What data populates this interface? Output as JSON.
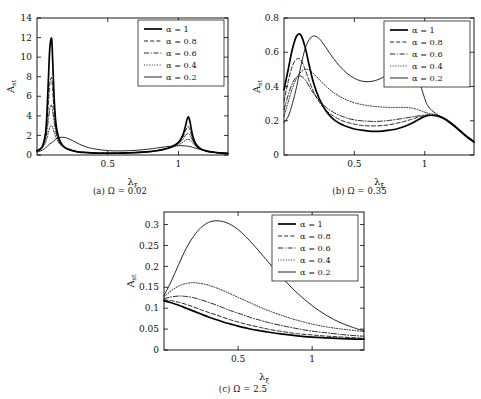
{
  "figure": {
    "ylabel": "A",
    "ylabel_sub": "st",
    "xlabel": "λ",
    "xlabel_sub": "ξ"
  },
  "legend": {
    "entries": [
      {
        "label": "α = 1",
        "style": "solid-thick"
      },
      {
        "label": "α = 0.8",
        "style": "dashed"
      },
      {
        "label": "α = 0.6",
        "style": "dashdot"
      },
      {
        "label": "α = 0.4",
        "style": "dotted"
      },
      {
        "label": "α = 0.2",
        "style": "solid-thin"
      }
    ]
  },
  "panels": [
    {
      "id": "a",
      "caption": "(a) Ω = 0.02",
      "xticks": [
        0.5,
        1
      ],
      "xticklabels": [
        "0.5",
        "1"
      ],
      "yticks": [
        0,
        2,
        4,
        6,
        8,
        10,
        12,
        14
      ],
      "yticklabels": [
        "0",
        "2",
        "4",
        "6",
        "8",
        "10",
        "12",
        "14"
      ],
      "xlim": [
        0,
        1.35
      ],
      "ylim": [
        0,
        14
      ]
    },
    {
      "id": "b",
      "caption": "(b) Ω = 0.35",
      "xticks": [
        0.5,
        1
      ],
      "xticklabels": [
        "0.5",
        "1"
      ],
      "yticks": [
        0,
        0.2,
        0.4,
        0.6,
        0.8
      ],
      "yticklabels": [
        "0",
        "0.2",
        "0.4",
        "0.6",
        "0.8"
      ],
      "xlim": [
        0,
        1.35
      ],
      "ylim": [
        0,
        0.8
      ]
    },
    {
      "id": "c",
      "caption": "(c) Ω = 2.5",
      "xticks": [
        0.5,
        1
      ],
      "xticklabels": [
        "0.5",
        "1"
      ],
      "yticks": [
        0,
        0.05,
        0.1,
        0.15,
        0.2,
        0.25,
        0.3
      ],
      "yticklabels": [
        "0",
        "0.05",
        "0.1",
        "0.15",
        "0.2",
        "0.25",
        "0.3"
      ],
      "xlim": [
        0,
        1.35
      ],
      "ylim": [
        0,
        0.33
      ]
    }
  ],
  "chart_data": [
    {
      "type": "line",
      "panel": "a",
      "title": "(a) Ω = 0.02",
      "xlabel": "λ_ξ",
      "ylabel": "A_st",
      "xlim": [
        0,
        1.35
      ],
      "ylim": [
        0,
        14
      ],
      "grid": false,
      "legend_position": "top-right",
      "x": [
        0,
        0.02,
        0.04,
        0.06,
        0.07,
        0.08,
        0.09,
        0.1,
        0.105,
        0.11,
        0.12,
        0.13,
        0.14,
        0.16,
        0.18,
        0.2,
        0.22,
        0.25,
        0.3,
        0.35,
        0.4,
        0.5,
        0.6,
        0.7,
        0.8,
        0.85,
        0.9,
        0.95,
        1.0,
        1.03,
        1.05,
        1.06,
        1.07,
        1.08,
        1.09,
        1.1,
        1.12,
        1.15,
        1.2,
        1.25,
        1.3,
        1.35
      ],
      "series": [
        {
          "name": "α = 1",
          "style": "solid-thick",
          "values": [
            0.45,
            0.6,
            0.95,
            2.2,
            4.2,
            7.5,
            10.8,
            11.9,
            11.6,
            10.0,
            6.2,
            3.8,
            2.6,
            1.5,
            1.0,
            0.75,
            0.6,
            0.45,
            0.3,
            0.25,
            0.2,
            0.18,
            0.2,
            0.25,
            0.35,
            0.45,
            0.6,
            0.85,
            1.3,
            2.0,
            3.0,
            3.6,
            3.9,
            3.5,
            2.7,
            2.0,
            1.2,
            0.7,
            0.4,
            0.28,
            0.2,
            0.15
          ]
        },
        {
          "name": "α = 0.8",
          "style": "dashed",
          "values": [
            0.42,
            0.58,
            0.9,
            1.9,
            3.2,
            5.2,
            7.2,
            7.9,
            7.7,
            6.8,
            4.6,
            3.1,
            2.2,
            1.35,
            0.95,
            0.72,
            0.58,
            0.44,
            0.3,
            0.24,
            0.2,
            0.18,
            0.2,
            0.25,
            0.34,
            0.44,
            0.58,
            0.82,
            1.25,
            1.8,
            2.5,
            2.8,
            2.9,
            2.6,
            2.1,
            1.65,
            1.05,
            0.65,
            0.38,
            0.27,
            0.2,
            0.15
          ]
        },
        {
          "name": "α = 0.6",
          "style": "dashdot",
          "values": [
            0.4,
            0.55,
            0.85,
            1.6,
            2.4,
            3.6,
            4.7,
            5.1,
            5.0,
            4.6,
            3.5,
            2.6,
            1.95,
            1.25,
            0.92,
            0.7,
            0.57,
            0.44,
            0.31,
            0.25,
            0.21,
            0.19,
            0.21,
            0.26,
            0.35,
            0.45,
            0.58,
            0.8,
            1.2,
            1.6,
            2.0,
            2.15,
            2.2,
            2.05,
            1.8,
            1.5,
            1.0,
            0.62,
            0.37,
            0.26,
            0.2,
            0.15
          ]
        },
        {
          "name": "α = 0.4",
          "style": "dotted",
          "values": [
            0.38,
            0.5,
            0.75,
            1.25,
            1.7,
            2.3,
            2.8,
            3.0,
            2.98,
            2.85,
            2.4,
            1.95,
            1.6,
            1.12,
            0.87,
            0.7,
            0.58,
            0.46,
            0.33,
            0.27,
            0.23,
            0.21,
            0.23,
            0.28,
            0.37,
            0.46,
            0.58,
            0.76,
            1.05,
            1.3,
            1.5,
            1.58,
            1.6,
            1.55,
            1.42,
            1.25,
            0.92,
            0.6,
            0.37,
            0.27,
            0.21,
            0.16
          ]
        },
        {
          "name": "α = 0.2",
          "style": "solid-thin",
          "values": [
            0.3,
            0.38,
            0.52,
            0.72,
            0.85,
            0.98,
            1.12,
            1.22,
            1.27,
            1.32,
            1.45,
            1.58,
            1.68,
            1.79,
            1.82,
            1.78,
            1.68,
            1.48,
            1.1,
            0.82,
            0.64,
            0.45,
            0.42,
            0.48,
            0.62,
            0.72,
            0.82,
            0.9,
            0.95,
            0.95,
            0.93,
            0.91,
            0.89,
            0.86,
            0.83,
            0.79,
            0.7,
            0.58,
            0.42,
            0.31,
            0.24,
            0.18
          ]
        }
      ]
    },
    {
      "type": "line",
      "panel": "b",
      "title": "(b) Ω = 0.35",
      "xlabel": "λ_ξ",
      "ylabel": "A_st",
      "xlim": [
        0,
        1.35
      ],
      "ylim": [
        0,
        0.8
      ],
      "grid": false,
      "legend_position": "top-right",
      "x": [
        0,
        0.03,
        0.06,
        0.09,
        0.12,
        0.15,
        0.18,
        0.21,
        0.25,
        0.3,
        0.35,
        0.4,
        0.45,
        0.5,
        0.55,
        0.6,
        0.65,
        0.7,
        0.75,
        0.8,
        0.85,
        0.9,
        0.95,
        1.0,
        1.02,
        1.05,
        1.1,
        1.15,
        1.2,
        1.25,
        1.3,
        1.35
      ],
      "series": [
        {
          "name": "α = 1",
          "style": "solid-thick",
          "values": [
            0.38,
            0.5,
            0.62,
            0.695,
            0.7,
            0.63,
            0.52,
            0.42,
            0.33,
            0.255,
            0.21,
            0.183,
            0.165,
            0.152,
            0.145,
            0.14,
            0.138,
            0.14,
            0.145,
            0.152,
            0.165,
            0.182,
            0.205,
            0.225,
            0.23,
            0.232,
            0.225,
            0.205,
            0.175,
            0.14,
            0.105,
            0.075
          ]
        },
        {
          "name": "α = 0.8",
          "style": "dashed",
          "values": [
            0.315,
            0.43,
            0.52,
            0.56,
            0.555,
            0.5,
            0.43,
            0.37,
            0.31,
            0.26,
            0.228,
            0.205,
            0.19,
            0.18,
            0.173,
            0.17,
            0.17,
            0.172,
            0.177,
            0.185,
            0.195,
            0.207,
            0.22,
            0.228,
            0.23,
            0.232,
            0.226,
            0.208,
            0.178,
            0.143,
            0.108,
            0.078
          ]
        },
        {
          "name": "α = 0.6",
          "style": "dashdot",
          "values": [
            0.265,
            0.35,
            0.42,
            0.455,
            0.46,
            0.44,
            0.4,
            0.36,
            0.32,
            0.278,
            0.25,
            0.23,
            0.215,
            0.205,
            0.2,
            0.197,
            0.196,
            0.198,
            0.202,
            0.208,
            0.214,
            0.221,
            0.228,
            0.233,
            0.234,
            0.234,
            0.228,
            0.21,
            0.18,
            0.145,
            0.11,
            0.08
          ]
        },
        {
          "name": "α = 0.4",
          "style": "dotted",
          "values": [
            0.225,
            0.31,
            0.39,
            0.45,
            0.485,
            0.5,
            0.495,
            0.475,
            0.44,
            0.4,
            0.365,
            0.34,
            0.32,
            0.305,
            0.295,
            0.288,
            0.283,
            0.28,
            0.278,
            0.278,
            0.278,
            0.275,
            0.265,
            0.25,
            0.245,
            0.24,
            0.23,
            0.212,
            0.183,
            0.148,
            0.112,
            0.082
          ]
        },
        {
          "name": "α = 0.2",
          "style": "solid-thin",
          "values": [
            0.19,
            0.225,
            0.3,
            0.4,
            0.52,
            0.62,
            0.675,
            0.695,
            0.68,
            0.625,
            0.565,
            0.515,
            0.475,
            0.448,
            0.432,
            0.428,
            0.435,
            0.452,
            0.475,
            0.495,
            0.508,
            0.505,
            0.45,
            0.33,
            0.29,
            0.26,
            0.23,
            0.205,
            0.175,
            0.142,
            0.108,
            0.08
          ]
        }
      ]
    },
    {
      "type": "line",
      "panel": "c",
      "title": "(c) Ω = 2.5",
      "xlabel": "λ_ξ",
      "ylabel": "A_st",
      "xlim": [
        0,
        1.35
      ],
      "ylim": [
        0,
        0.33
      ],
      "grid": false,
      "legend_position": "top-right",
      "x": [
        0,
        0.05,
        0.1,
        0.15,
        0.2,
        0.25,
        0.3,
        0.35,
        0.4,
        0.45,
        0.5,
        0.55,
        0.6,
        0.65,
        0.7,
        0.8,
        0.9,
        1.0,
        1.1,
        1.2,
        1.3,
        1.35
      ],
      "series": [
        {
          "name": "α = 1",
          "style": "solid-thick",
          "values": [
            0.118,
            0.113,
            0.107,
            0.1,
            0.093,
            0.086,
            0.079,
            0.073,
            0.067,
            0.062,
            0.057,
            0.053,
            0.049,
            0.046,
            0.043,
            0.038,
            0.034,
            0.031,
            0.029,
            0.027,
            0.026,
            0.026
          ]
        },
        {
          "name": "α = 0.8",
          "style": "dashed",
          "values": [
            0.12,
            0.118,
            0.114,
            0.109,
            0.103,
            0.096,
            0.09,
            0.084,
            0.078,
            0.072,
            0.067,
            0.062,
            0.058,
            0.054,
            0.05,
            0.044,
            0.039,
            0.036,
            0.033,
            0.031,
            0.029,
            0.028
          ]
        },
        {
          "name": "α = 0.6",
          "style": "dashdot",
          "values": [
            0.123,
            0.127,
            0.129,
            0.128,
            0.125,
            0.12,
            0.114,
            0.108,
            0.101,
            0.094,
            0.088,
            0.082,
            0.076,
            0.071,
            0.066,
            0.058,
            0.051,
            0.045,
            0.041,
            0.037,
            0.034,
            0.033
          ]
        },
        {
          "name": "α = 0.4",
          "style": "dotted",
          "values": [
            0.127,
            0.142,
            0.153,
            0.159,
            0.161,
            0.159,
            0.155,
            0.149,
            0.142,
            0.134,
            0.126,
            0.118,
            0.11,
            0.102,
            0.095,
            0.082,
            0.071,
            0.062,
            0.055,
            0.05,
            0.046,
            0.044
          ]
        },
        {
          "name": "α = 0.2",
          "style": "solid-thin",
          "values": [
            0.13,
            0.165,
            0.205,
            0.243,
            0.272,
            0.293,
            0.305,
            0.309,
            0.307,
            0.3,
            0.288,
            0.272,
            0.253,
            0.233,
            0.212,
            0.172,
            0.136,
            0.106,
            0.082,
            0.064,
            0.051,
            0.046
          ]
        }
      ]
    }
  ]
}
